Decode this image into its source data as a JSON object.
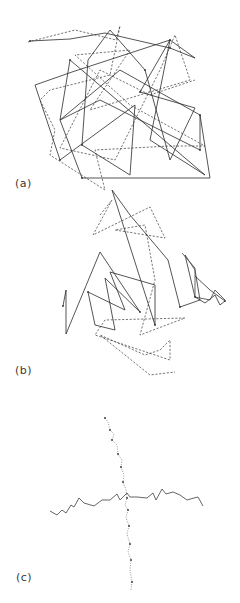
{
  "figure": {
    "panels": [
      {
        "id": "a",
        "label": "(a)",
        "description": "Two overlapping random-walk chains, one solid and one dashed, densely tangled",
        "solid_path": [
          [
            30,
            41
          ],
          [
            70,
            39
          ],
          [
            105,
            33
          ],
          [
            170,
            48
          ],
          [
            195,
            58
          ],
          [
            170,
            40
          ],
          [
            140,
            92
          ],
          [
            195,
            108
          ],
          [
            170,
            160
          ],
          [
            145,
            70
          ],
          [
            110,
            30
          ],
          [
            88,
            60
          ],
          [
            82,
            145
          ],
          [
            130,
            175
          ],
          [
            135,
            105
          ],
          [
            60,
            160
          ],
          [
            35,
            85
          ],
          [
            72,
            72
          ],
          [
            170,
            40
          ],
          [
            150,
            140
          ],
          [
            205,
            175
          ],
          [
            70,
            60
          ],
          [
            60,
            120
          ],
          [
            100,
            100
          ],
          [
            200,
            150
          ],
          [
            200,
            115
          ],
          [
            210,
            178
          ],
          [
            82,
            178
          ],
          [
            60,
            120
          ],
          [
            120,
            70
          ],
          [
            200,
            115
          ]
        ],
        "dashed_path": [
          [
            28,
            42
          ],
          [
            75,
            30
          ],
          [
            116,
            40
          ],
          [
            120,
            26
          ],
          [
            110,
            75
          ],
          [
            50,
            90
          ],
          [
            40,
            100
          ],
          [
            55,
            130
          ],
          [
            50,
            155
          ],
          [
            105,
            190
          ],
          [
            95,
            150
          ],
          [
            170,
            146
          ],
          [
            205,
            146
          ],
          [
            130,
            105
          ],
          [
            75,
            55
          ],
          [
            130,
            50
          ],
          [
            90,
            110
          ],
          [
            190,
            80
          ],
          [
            175,
            35
          ],
          [
            160,
            70
          ],
          [
            115,
            160
          ],
          [
            60,
            148
          ],
          [
            100,
            70
          ],
          [
            150,
            95
          ],
          [
            195,
            80
          ]
        ]
      },
      {
        "id": "b",
        "label": "(b)",
        "description": "Two chains, more compact/folded; solid chain with tails extending left and right, dashed chain with loop below",
        "solid_path": [
          [
            63,
            306
          ],
          [
            66,
            290
          ],
          [
            66,
            334
          ],
          [
            100,
            252
          ],
          [
            140,
            312
          ],
          [
            105,
            278
          ],
          [
            115,
            330
          ],
          [
            95,
            325
          ],
          [
            88,
            292
          ],
          [
            125,
            310
          ],
          [
            110,
            272
          ],
          [
            155,
            285
          ],
          [
            155,
            325
          ],
          [
            112,
            190
          ],
          [
            130,
            215
          ],
          [
            168,
            260
          ],
          [
            180,
            307
          ],
          [
            200,
            300
          ],
          [
            195,
            270
          ],
          [
            185,
            255
          ],
          [
            195,
            297
          ],
          [
            205,
            303
          ],
          [
            215,
            295
          ],
          [
            220,
            305
          ],
          [
            225,
            301
          ],
          [
            210,
            290
          ],
          [
            195,
            276
          ]
        ],
        "solid_tail": [
          [
            182,
            253
          ],
          [
            195,
            268
          ],
          [
            195,
            297
          ],
          [
            210,
            300
          ],
          [
            215,
            290
          ],
          [
            225,
            300
          ]
        ],
        "dashed_path": [
          [
            100,
            215
          ],
          [
            112,
            200
          ],
          [
            93,
            235
          ],
          [
            150,
            207
          ],
          [
            165,
            238
          ],
          [
            115,
            230
          ],
          [
            145,
            225
          ],
          [
            155,
            280
          ],
          [
            140,
            335
          ],
          [
            185,
            318
          ],
          [
            105,
            320
          ],
          [
            95,
            335
          ],
          [
            170,
            360
          ],
          [
            170,
            340
          ],
          [
            160,
            350
          ],
          [
            145,
            355
          ],
          [
            100,
            335
          ],
          [
            150,
            375
          ],
          [
            175,
            372
          ]
        ]
      },
      {
        "id": "c",
        "label": "(c)",
        "description": "Two extended chains crossing at right angles: solid chain horizontal, dotted chain vertical",
        "solid_path": [
          [
            50,
            511
          ],
          [
            57,
            515
          ],
          [
            62,
            510
          ],
          [
            66,
            513
          ],
          [
            71,
            505
          ],
          [
            74,
            507
          ],
          [
            79,
            498
          ],
          [
            84,
            503
          ],
          [
            94,
            506
          ],
          [
            102,
            500
          ],
          [
            110,
            500
          ],
          [
            117,
            494
          ],
          [
            120,
            500
          ],
          [
            127,
            493
          ],
          [
            130,
            497
          ],
          [
            137,
            497
          ],
          [
            147,
            498
          ],
          [
            153,
            493
          ],
          [
            156,
            500
          ],
          [
            162,
            489
          ],
          [
            166,
            494
          ],
          [
            173,
            492
          ],
          [
            180,
            495
          ],
          [
            187,
            500
          ],
          [
            194,
            498
          ],
          [
            198,
            497
          ],
          [
            203,
            506
          ]
        ],
        "dotted_path": [
          [
            105,
            418
          ],
          [
            108,
            422
          ],
          [
            110,
            430
          ],
          [
            114,
            434
          ],
          [
            112,
            440
          ],
          [
            117,
            445
          ],
          [
            118,
            454
          ],
          [
            122,
            460
          ],
          [
            121,
            467
          ],
          [
            124,
            475
          ],
          [
            123,
            482
          ],
          [
            126,
            490
          ],
          [
            127,
            498
          ],
          [
            125,
            505
          ],
          [
            128,
            510
          ],
          [
            126,
            518
          ],
          [
            129,
            526
          ],
          [
            127,
            534
          ],
          [
            130,
            544
          ],
          [
            128,
            552
          ],
          [
            131,
            560
          ],
          [
            130,
            570
          ],
          [
            132,
            582
          ],
          [
            131,
            590
          ]
        ]
      }
    ]
  }
}
